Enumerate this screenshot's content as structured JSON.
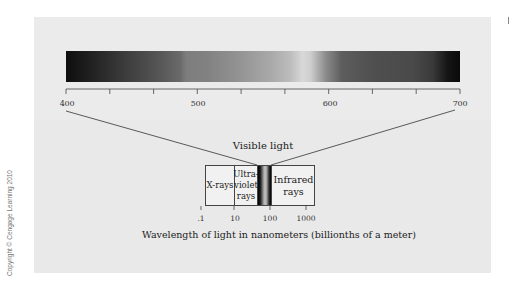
{
  "figure": {
    "spectrum_axis": {
      "range": [
        400,
        700
      ],
      "tick_step": 33.33,
      "tick_count": 10,
      "labels": [
        "400",
        "500",
        "600",
        "700"
      ],
      "unit": "nm"
    },
    "visible_label": "Visible light",
    "em_spectrum": {
      "regions": [
        {
          "name": "X-rays",
          "label": "X-rays"
        },
        {
          "name": "Ultraviolet rays",
          "label_lines": [
            "Ultra-",
            "violet",
            "rays"
          ]
        },
        {
          "name": "Visible light",
          "label": ""
        },
        {
          "name": "Infrared rays",
          "label_lines": [
            "Infrared",
            "rays"
          ]
        }
      ],
      "log_axis_labels": [
        ".1",
        "10",
        "100",
        "1000"
      ]
    },
    "caption": "Wavelength of light in nanometers (billionths of a meter)",
    "copyright": "Copyright © Cengage Learning 2010"
  },
  "colors": {
    "panel_background": "#ececec",
    "line_color": "#444444",
    "spectrum_style": "grayscale"
  }
}
